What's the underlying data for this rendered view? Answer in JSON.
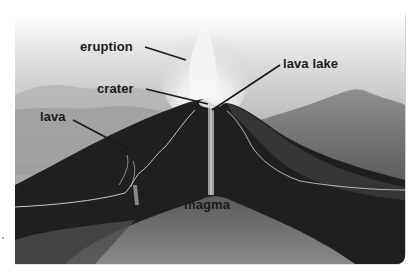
{
  "diagram": {
    "colors": {
      "background": "#ffffff",
      "sky_top": "#f4f4f4",
      "sky_bottom": "#a9a9a9",
      "volcano_dark": "#1e1e1e",
      "magma_gray": "#6e6e6e",
      "label_text": "#1c1c1c",
      "leader_line": "#1a1a1a",
      "lava_highlight": "#d8d8d8"
    },
    "labels": [
      {
        "id": "eruption",
        "text": "eruption",
        "x": 80,
        "y": 40,
        "leader": [
          [
            145,
            47
          ],
          [
            186,
            60
          ]
        ]
      },
      {
        "id": "crater",
        "text": "crater",
        "x": 97,
        "y": 82,
        "leader": [
          [
            146,
            89
          ],
          [
            208,
            104
          ]
        ]
      },
      {
        "id": "lava-lake",
        "text": "lava lake",
        "x": 283,
        "y": 57,
        "leader": [
          [
            280,
            65
          ],
          [
            212,
            110
          ]
        ]
      },
      {
        "id": "lava",
        "text": "lava",
        "x": 40,
        "y": 110,
        "leader": [
          [
            73,
            120
          ],
          [
            130,
            150
          ]
        ]
      },
      {
        "id": "magma",
        "text": "magma",
        "x": 184,
        "y": 198,
        "leader": []
      }
    ]
  }
}
